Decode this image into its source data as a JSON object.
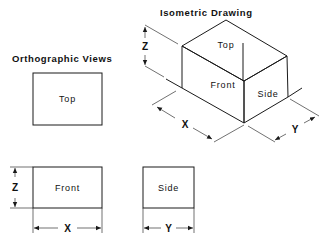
{
  "titles": {
    "orthographic": "Orthographic Views",
    "isometric": "Isometric Drawing"
  },
  "orthographic": {
    "top_view": {
      "label": "Top"
    },
    "front_view": {
      "label": "Front",
      "dim_width": "X",
      "dim_height": "Z"
    },
    "side_view": {
      "label": "Side",
      "dim_width": "Y"
    }
  },
  "isometric": {
    "faces": {
      "top": "Top",
      "front": "Front",
      "side": "Side"
    },
    "dims": {
      "x": "X",
      "y": "Y",
      "z": "Z"
    }
  },
  "colors": {
    "line": "#1a1a1a",
    "background": "#ffffff"
  }
}
